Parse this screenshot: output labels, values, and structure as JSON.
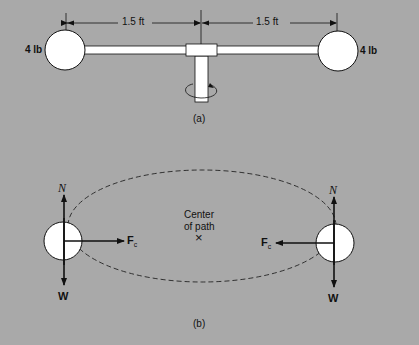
{
  "figure": {
    "background": "#a9a9a9",
    "part_a": {
      "caption": "(a)",
      "left_weight": "4 lb",
      "right_weight": "4 lb",
      "left_dimension": "1.5 ft",
      "right_dimension": "1.5 ft"
    },
    "part_b": {
      "caption": "(b)",
      "center_label_line1": "Center",
      "center_label_line2": "of path",
      "center_marker": "×",
      "normal_force": "N",
      "weight_force": "W",
      "centripetal_force": "F",
      "centripetal_subscript": "c"
    }
  }
}
